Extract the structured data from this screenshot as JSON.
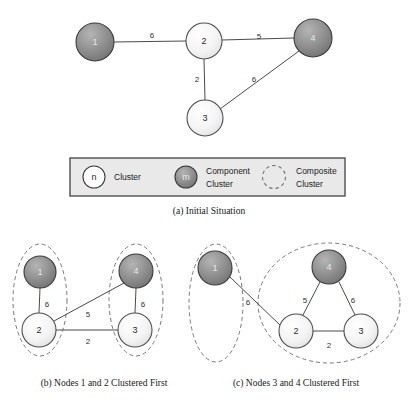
{
  "figure": {
    "background_color": "#ffffff",
    "colors": {
      "edge": "#4a4a4a",
      "cluster_light_fill": "#f2f2f2",
      "cluster_dark_fill": "#8d8d8d",
      "composite_outline": "#7a7a7a",
      "legend_background": "#e9e9e9",
      "legend_border": "#4f4f4f",
      "node_label_light": "#2a2a2a",
      "node_label_dark": "#e8e8e8",
      "edge_label": "#303030"
    }
  },
  "panel_a": {
    "caption": "(a)  Initial Situation",
    "nodes": [
      {
        "id": "a1",
        "label": "1",
        "kind": "component",
        "cx": 95,
        "cy": 42,
        "r": 19
      },
      {
        "id": "a2",
        "label": "2",
        "kind": "cluster",
        "cx": 204,
        "cy": 41,
        "r": 18
      },
      {
        "id": "a4",
        "label": "4",
        "kind": "component",
        "cx": 313,
        "cy": 38,
        "r": 19
      },
      {
        "id": "a3",
        "label": "3",
        "kind": "cluster",
        "cx": 205,
        "cy": 118,
        "r": 18
      }
    ],
    "edges": [
      {
        "from": "a1",
        "to": "a2",
        "weight": "6",
        "lx": 152,
        "ly": 35
      },
      {
        "from": "a2",
        "to": "a4",
        "weight": "5",
        "lx": 259,
        "ly": 36
      },
      {
        "from": "a2",
        "to": "a3",
        "weight": "2",
        "lx": 197,
        "ly": 79
      },
      {
        "from": "a3",
        "to": "a4",
        "weight": "6",
        "lx": 254,
        "ly": 79
      }
    ]
  },
  "legend": {
    "box": {
      "x": 70,
      "y": 158,
      "width": 275,
      "height": 38
    },
    "items": [
      {
        "icon": "cluster-circle-icon",
        "icon_label": "n",
        "kind": "cluster",
        "lines": [
          "Cluster"
        ]
      },
      {
        "icon": "component-cluster-circle-icon",
        "icon_label": "m",
        "kind": "component",
        "lines": [
          "Component",
          "Cluster"
        ]
      },
      {
        "icon": "composite-cluster-dashed-icon",
        "icon_label": "",
        "kind": "composite",
        "lines": [
          "Composite",
          "Cluster"
        ]
      }
    ]
  },
  "panel_b": {
    "caption": "(b)  Nodes 1 and 2 Clustered First",
    "nodes": [
      {
        "id": "b1",
        "label": "1",
        "kind": "component",
        "cx": 40,
        "cy": 272,
        "r": 16
      },
      {
        "id": "b2",
        "label": "2",
        "kind": "cluster",
        "cx": 39,
        "cy": 330,
        "r": 17
      },
      {
        "id": "b4",
        "label": "4",
        "kind": "component",
        "cx": 136,
        "cy": 271,
        "r": 17
      },
      {
        "id": "b3",
        "label": "3",
        "kind": "cluster",
        "cx": 135,
        "cy": 330,
        "r": 17
      }
    ],
    "edges": [
      {
        "from": "b1",
        "to": "b2",
        "weight": "6",
        "lx": 47,
        "ly": 304
      },
      {
        "from": "b2",
        "to": "b4",
        "weight": "5",
        "lx": 88,
        "ly": 314
      },
      {
        "from": "b2",
        "to": "b3",
        "weight": "2",
        "lx": 88,
        "ly": 341
      },
      {
        "from": "b4",
        "to": "b3",
        "weight": "6",
        "lx": 143,
        "ly": 304
      }
    ],
    "composites": [
      {
        "cx": 40,
        "cy": 300,
        "rx": 27,
        "ry": 56
      },
      {
        "cx": 136,
        "cy": 300,
        "rx": 27,
        "ry": 56
      }
    ]
  },
  "panel_c": {
    "caption": "(c)  Nodes 3 and 4 Clustered First",
    "nodes": [
      {
        "id": "c1",
        "label": "1",
        "kind": "component",
        "cx": 215,
        "cy": 268,
        "r": 17
      },
      {
        "id": "c4",
        "label": "4",
        "kind": "component",
        "cx": 329,
        "cy": 267,
        "r": 17
      },
      {
        "id": "c2",
        "label": "2",
        "kind": "cluster",
        "cx": 296,
        "cy": 331,
        "r": 17
      },
      {
        "id": "c3",
        "label": "3",
        "kind": "cluster",
        "cx": 361,
        "cy": 331,
        "r": 17
      }
    ],
    "edges": [
      {
        "from": "c1",
        "to": "c2",
        "weight": "6",
        "lx": 248,
        "ly": 302
      },
      {
        "from": "c4",
        "to": "c2",
        "weight": "5",
        "lx": 305,
        "ly": 300
      },
      {
        "from": "c4",
        "to": "c3",
        "weight": "6",
        "lx": 353,
        "ly": 300
      },
      {
        "from": "c2",
        "to": "c3",
        "weight": "2",
        "lx": 329,
        "ly": 345
      }
    ],
    "composites": [
      {
        "cx": 216,
        "cy": 303,
        "rx": 27,
        "ry": 59
      },
      {
        "cx": 329,
        "cy": 303,
        "rx": 71,
        "ry": 60
      }
    ]
  }
}
